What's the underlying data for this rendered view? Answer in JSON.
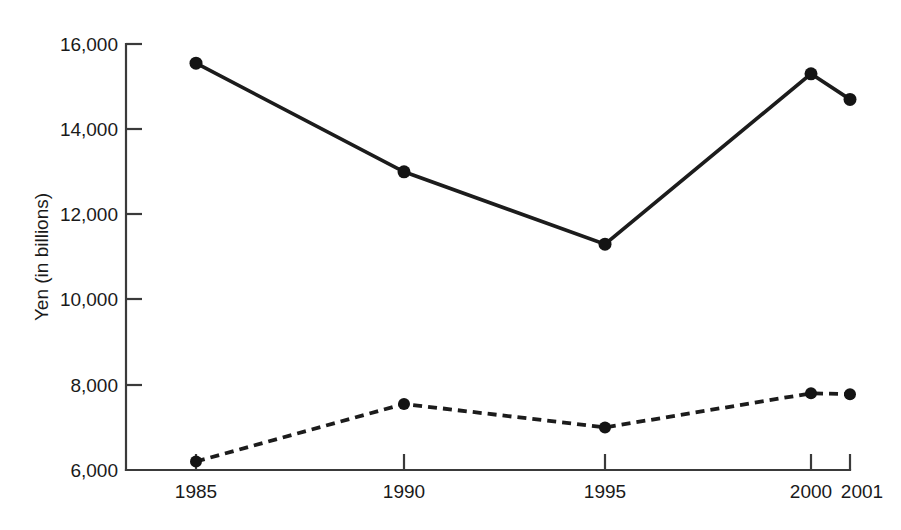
{
  "chart_data": {
    "type": "line",
    "title": "",
    "xlabel": "",
    "ylabel": "Yen (in billions)",
    "x": [
      1985,
      1990,
      1995,
      2000,
      2001
    ],
    "categories": [
      "1985",
      "1990",
      "1995",
      "2000",
      "2001"
    ],
    "xlim": [
      1985,
      2001
    ],
    "ylim": [
      6000,
      16000
    ],
    "yticks": [
      6000,
      8000,
      10000,
      12000,
      14000,
      16000
    ],
    "ytick_labels": [
      "6,000",
      "8,000",
      "10,000",
      "12,000",
      "14,000",
      "16,000"
    ],
    "xtick_labels": [
      "1985",
      "1990",
      "1995",
      "2000",
      "2001"
    ],
    "grid": false,
    "legend": "none",
    "series": [
      {
        "name": "solid-series",
        "style": "solid",
        "marker": "filled-circle",
        "color": "#1c1c1c",
        "values": [
          15550,
          13000,
          11300,
          15300,
          14700
        ]
      },
      {
        "name": "dashed-series",
        "style": "dashed",
        "marker": "filled-circle",
        "color": "#1c1c1c",
        "values": [
          6200,
          7550,
          7000,
          7800,
          7780
        ]
      }
    ]
  },
  "axes": {
    "y_axis_title": "Yen (in billions)",
    "y_tick_labels": [
      "16,000",
      "14,000",
      "12,000",
      "10,000",
      "8,000",
      "6,000"
    ],
    "x_tick_labels": [
      "1985",
      "1990",
      "1995",
      "2000",
      "2001"
    ]
  }
}
